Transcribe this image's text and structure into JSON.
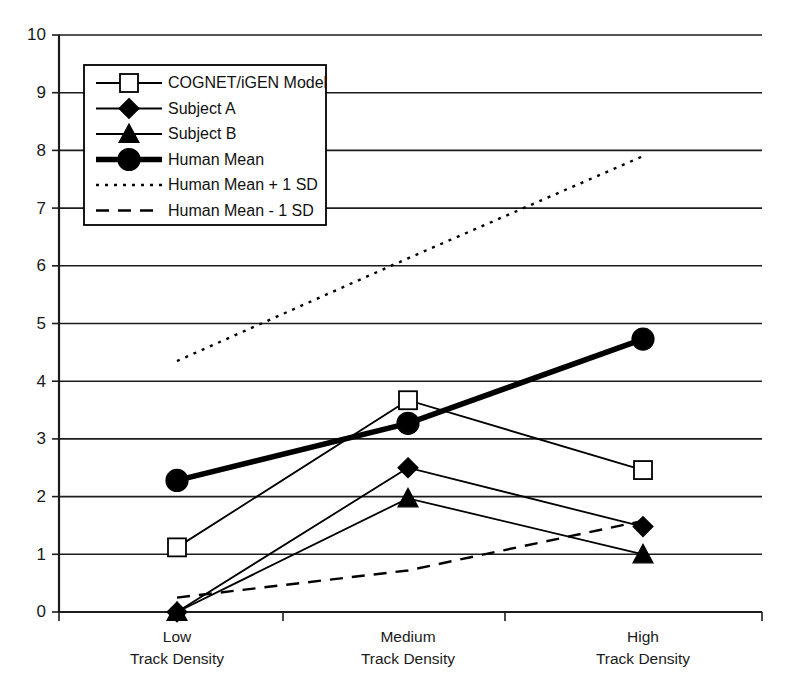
{
  "chart_data": {
    "type": "line",
    "title": "",
    "subtitle": "",
    "xlabel": "",
    "ylabel": "",
    "categories": [
      "Low\nTrack Density",
      "Medium\nTrack Density",
      "High\nTrack Density"
    ],
    "category_labels": [
      {
        "line1": "Low",
        "line2": "Track Density"
      },
      {
        "line1": "Medium",
        "line2": "Track Density"
      },
      {
        "line1": "High",
        "line2": "Track Density"
      }
    ],
    "ylim": [
      0,
      10
    ],
    "ytick_values": [
      0,
      1,
      2,
      3,
      4,
      5,
      6,
      7,
      8,
      9,
      10
    ],
    "ytick_labels": [
      "0",
      "1",
      "2",
      "3",
      "4",
      "5",
      "6",
      "7",
      "8",
      "9",
      "10"
    ],
    "grid": true,
    "grid_axis": "y",
    "legend_position": "upper-left-inside",
    "series": [
      {
        "name": "COGNET/iGEN Model",
        "marker": "open-square",
        "line_style": "solid-thin",
        "values": [
          1.12,
          3.67,
          2.46
        ]
      },
      {
        "name": "Subject A",
        "marker": "solid-diamond",
        "line_style": "solid-thin",
        "values": [
          0.0,
          2.5,
          1.48
        ]
      },
      {
        "name": "Subject B",
        "marker": "solid-triangle",
        "line_style": "solid-thin",
        "values": [
          0.0,
          1.97,
          1.0
        ]
      },
      {
        "name": "Human Mean",
        "marker": "solid-circle",
        "line_style": "solid-thick",
        "values": [
          2.28,
          3.27,
          4.73
        ]
      },
      {
        "name": "Human Mean + 1 SD",
        "marker": "none",
        "line_style": "dotted",
        "values": [
          4.35,
          6.13,
          7.9
        ]
      },
      {
        "name": "Human Mean - 1 SD",
        "marker": "none",
        "line_style": "dashed",
        "values": [
          0.25,
          0.72,
          1.58
        ]
      }
    ],
    "legend_entries": [
      {
        "label": "COGNET/iGEN Model",
        "marker": "open-square",
        "line_style": "solid-thin"
      },
      {
        "label": "Subject A",
        "marker": "solid-diamond",
        "line_style": "solid-thin"
      },
      {
        "label": "Subject B",
        "marker": "solid-triangle",
        "line_style": "solid-thin"
      },
      {
        "label": "Human Mean",
        "marker": "solid-circle",
        "line_style": "solid-thick"
      },
      {
        "label": "Human Mean + 1 SD",
        "marker": "none",
        "line_style": "dotted"
      },
      {
        "label": "Human Mean - 1 SD",
        "marker": "none",
        "line_style": "dashed"
      }
    ],
    "colors": {
      "line": "#000000",
      "grid": "#1c1c1c",
      "axis": "#1c1c1c",
      "background": "#ffffff",
      "text": "#111111"
    }
  }
}
